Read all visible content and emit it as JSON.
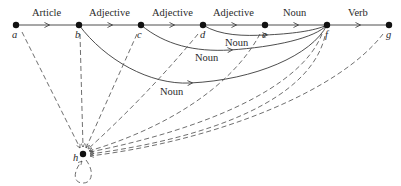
{
  "diagram": {
    "type": "state-transition-network",
    "colors": {
      "ink": "#2a2a2a",
      "background": "#ffffff"
    },
    "nodes": [
      {
        "id": "a",
        "label": "a",
        "x": 16,
        "y": 25
      },
      {
        "id": "b",
        "label": "b",
        "x": 79,
        "y": 25
      },
      {
        "id": "c",
        "label": "c",
        "x": 141,
        "y": 25
      },
      {
        "id": "d",
        "label": "d",
        "x": 203,
        "y": 25
      },
      {
        "id": "e",
        "label": "e",
        "x": 265,
        "y": 25
      },
      {
        "id": "f",
        "label": "f",
        "x": 327,
        "y": 25
      },
      {
        "id": "g",
        "label": "g",
        "x": 389,
        "y": 25
      },
      {
        "id": "h",
        "label": "h",
        "x": 83,
        "y": 154
      }
    ],
    "edges_main": [
      {
        "from": "a",
        "to": "b",
        "label": "Article"
      },
      {
        "from": "b",
        "to": "c",
        "label": "Adjective"
      },
      {
        "from": "c",
        "to": "d",
        "label": "Adjective"
      },
      {
        "from": "d",
        "to": "e",
        "label": "Adjective"
      },
      {
        "from": "e",
        "to": "f",
        "label": "Noun"
      },
      {
        "from": "f",
        "to": "g",
        "label": "Verb"
      }
    ],
    "edges_arcs": [
      {
        "from": "d",
        "to": "f",
        "label": "Noun"
      },
      {
        "from": "c",
        "to": "f",
        "label": "Noun"
      },
      {
        "from": "b",
        "to": "f",
        "label": "Noun"
      }
    ],
    "edges_failure": [
      {
        "from": "a",
        "to": "h",
        "style": "dashed"
      },
      {
        "from": "b",
        "to": "h",
        "style": "dashed"
      },
      {
        "from": "c",
        "to": "h",
        "style": "dashed"
      },
      {
        "from": "d",
        "to": "h",
        "style": "dashed"
      },
      {
        "from": "e",
        "to": "h",
        "style": "dashed"
      },
      {
        "from": "f",
        "to": "h",
        "style": "dashed"
      },
      {
        "from": "g",
        "to": "h",
        "style": "dashed"
      },
      {
        "from": "h",
        "to": "h",
        "style": "dashed-self-loop"
      }
    ]
  }
}
